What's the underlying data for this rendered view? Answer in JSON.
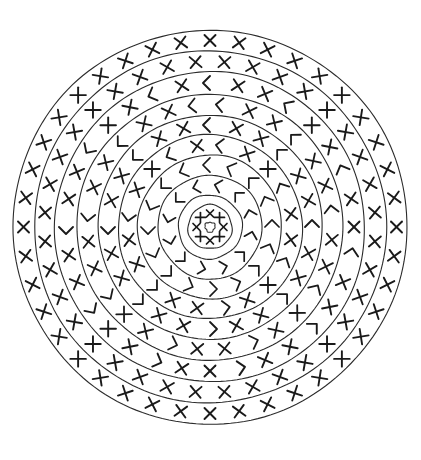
{
  "document": {
    "title": "Concentric Ring Mandala",
    "kind": "line-art-drawing",
    "background_color": "#ffffff",
    "stroke_color": "#2b2b2b",
    "glyph_color": "#1a1a1a",
    "canvas": {
      "width": 421,
      "height": 460
    }
  },
  "figure": {
    "name": "concentric-ring-mandala",
    "center": {
      "x": 210,
      "y": 227
    },
    "outer_radius": 197,
    "ring_count": 9,
    "circle_radii": [
      22,
      32,
      52,
      72,
      92,
      112,
      133,
      155,
      176,
      197
    ],
    "center_hub": {
      "outer_radius": 22,
      "inner_dot_radius": 5,
      "glyph": "x-mark",
      "glyph_count": 8,
      "glyph_size": 7
    },
    "bands": [
      {
        "index": 0,
        "name": "band-inner-1",
        "inner_radius": 32,
        "outer_radius": 52,
        "glyph": "corner-mark",
        "glyph_count": 12,
        "glyph_size": 9,
        "rotation_offset": 15
      },
      {
        "index": 1,
        "name": "band-inner-2",
        "inner_radius": 52,
        "outer_radius": 72,
        "glyph": "corner-mark",
        "glyph_count": 16,
        "glyph_size": 10,
        "rotation_offset": 0
      },
      {
        "index": 2,
        "name": "band-mid-1",
        "inner_radius": 72,
        "outer_radius": 92,
        "glyph": "mixed-x-corner",
        "glyph_count": 20,
        "glyph_size": 11,
        "rotation_offset": 9
      },
      {
        "index": 3,
        "name": "band-mid-2",
        "inner_radius": 92,
        "outer_radius": 112,
        "glyph": "mixed-x-corner",
        "glyph_count": 24,
        "glyph_size": 11,
        "rotation_offset": 0
      },
      {
        "index": 4,
        "name": "band-mid-3",
        "inner_radius": 112,
        "outer_radius": 133,
        "glyph": "mixed-x-corner",
        "glyph_count": 28,
        "glyph_size": 11,
        "rotation_offset": 6
      },
      {
        "index": 5,
        "name": "band-outer-1",
        "inner_radius": 133,
        "outer_radius": 155,
        "glyph": "mixed-x-corner",
        "glyph_count": 32,
        "glyph_size": 11,
        "rotation_offset": 0
      },
      {
        "index": 6,
        "name": "band-outer-2",
        "inner_radius": 155,
        "outer_radius": 176,
        "glyph": "x-mark",
        "glyph_count": 36,
        "glyph_size": 11,
        "rotation_offset": 5
      },
      {
        "index": 7,
        "name": "band-outer-3",
        "inner_radius": 176,
        "outer_radius": 197,
        "glyph": "x-mark",
        "glyph_count": 40,
        "glyph_size": 11,
        "rotation_offset": 0
      }
    ],
    "legend": {
      "x_mark_label": "X",
      "corner_mark_label": "corner tick",
      "chevron_label": "chevron"
    }
  }
}
